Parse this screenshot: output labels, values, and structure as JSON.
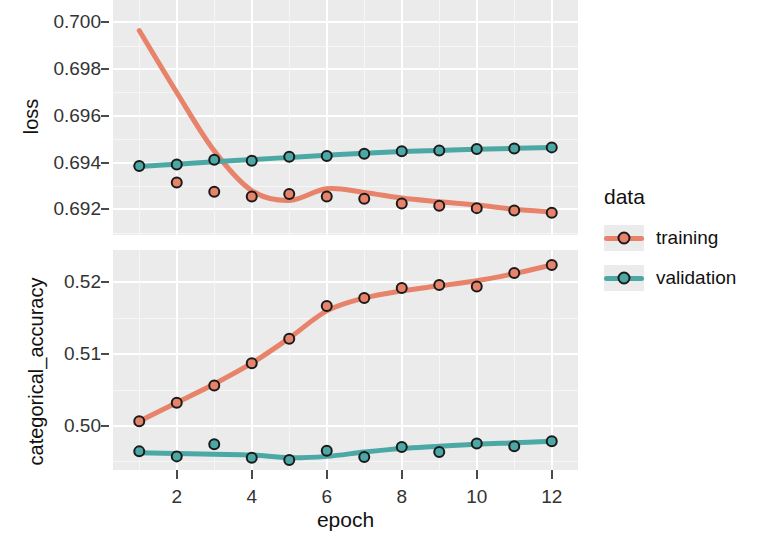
{
  "chart_data": {
    "type": "line",
    "title": "",
    "xlabel": "epoch",
    "x": [
      1,
      2,
      3,
      4,
      5,
      6,
      7,
      8,
      9,
      10,
      11,
      12
    ],
    "xlim": [
      0.3,
      12.7
    ],
    "xticks": [
      2,
      4,
      6,
      8,
      10,
      12
    ],
    "xticklabels": [
      "2",
      "4",
      "6",
      "8",
      "10",
      "12"
    ],
    "legend": {
      "title": "data",
      "position": "right",
      "entries": [
        {
          "name": "training",
          "color": "#E8836B"
        },
        {
          "name": "validation",
          "color": "#4BA8A5"
        }
      ]
    },
    "facets": [
      {
        "ylabel": "loss",
        "ylim": [
          0.6909,
          0.7013
        ],
        "yticks": [
          0.7,
          0.698,
          0.696,
          0.694,
          0.692
        ],
        "yticklabels": [
          "0.700",
          "0.698",
          "0.696",
          "0.694",
          "0.692"
        ],
        "series": [
          {
            "name": "training",
            "color": "#E8836B",
            "values": [
              0.70125,
              0.69315,
              0.69275,
              0.69255,
              0.69265,
              0.69255,
              0.69245,
              0.69225,
              0.69215,
              0.69205,
              0.69195,
              0.69185
            ],
            "smooth": [
              0.69965,
              0.697,
              0.6945,
              0.6928,
              0.69238,
              0.69288,
              0.69272,
              0.69248,
              0.69232,
              0.69218,
              0.692,
              0.69188
            ]
          },
          {
            "name": "validation",
            "color": "#4BA8A5",
            "values": [
              0.69385,
              0.69392,
              0.69412,
              0.69408,
              0.69425,
              0.69428,
              0.69438,
              0.69448,
              0.69452,
              0.69458,
              0.6946,
              0.69465
            ],
            "smooth": [
              0.69383,
              0.69393,
              0.69403,
              0.69413,
              0.69422,
              0.69431,
              0.6944,
              0.69447,
              0.69452,
              0.69457,
              0.69461,
              0.69465
            ]
          }
        ]
      },
      {
        "ylabel": "categorical_accuracy",
        "ylim": [
          0.4938,
          0.5245
        ],
        "yticks": [
          0.52,
          0.51,
          0.5
        ],
        "yticklabels": [
          "0.52",
          "0.51",
          "0.50"
        ],
        "series": [
          {
            "name": "training",
            "color": "#E8836B",
            "values": [
              0.5006,
              0.5032,
              0.5056,
              0.5087,
              0.5121,
              0.5167,
              0.5178,
              0.5192,
              0.5196,
              0.5194,
              0.5213,
              0.5224
            ],
            "smooth": [
              0.5006,
              0.5032,
              0.5058,
              0.5087,
              0.5122,
              0.516,
              0.5178,
              0.5188,
              0.5195,
              0.5202,
              0.5212,
              0.5224
            ]
          },
          {
            "name": "validation",
            "color": "#4BA8A5",
            "values": [
              0.4964,
              0.4957,
              0.4974,
              0.4955,
              0.4952,
              0.4965,
              0.4956,
              0.497,
              0.4963,
              0.4975,
              0.4971,
              0.4978
            ],
            "smooth": [
              0.4962,
              0.4961,
              0.496,
              0.4959,
              0.4955,
              0.4957,
              0.4963,
              0.4968,
              0.4971,
              0.4974,
              0.4976,
              0.4978
            ]
          }
        ]
      }
    ]
  }
}
